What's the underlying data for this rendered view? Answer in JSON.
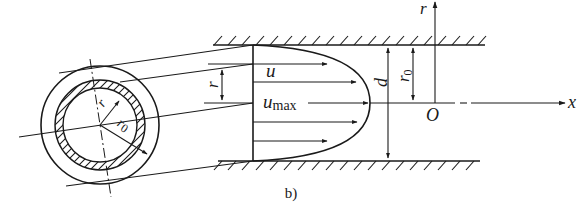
{
  "diagram": {
    "caption": "b)",
    "labels": {
      "u": "u",
      "u_max_main": "u",
      "u_max_sub": "max",
      "r_left": "r",
      "d": "d",
      "r0_main": "r",
      "r0_sub": "0",
      "r_axis": "r",
      "x_axis": "x",
      "origin": "O",
      "circle_r": "r",
      "circle_r0_main": "r",
      "circle_r0_sub": "0"
    },
    "colors": {
      "line": "#1a1a1a",
      "background": "#ffffff"
    },
    "elements": [
      "pipe cross-section with annular shaded ring (radius r, thickness dr)",
      "upper and lower pipe walls with hatching",
      "parabolic velocity profile with arrows",
      "dimension arrows for r, d, r0",
      "coordinate axes r (vertical) and x (horizontal) with origin O"
    ]
  }
}
